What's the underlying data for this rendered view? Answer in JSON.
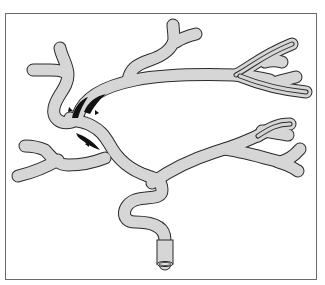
{
  "diagram": {
    "colors": {
      "background": "#ffffff",
      "frame": "#6a6a6a",
      "vessel_fill": "#d6d6d6",
      "vessel_outline": "#2a2a2a",
      "lesion": "#111111",
      "arrowhead": "#111111"
    },
    "markers": [
      {
        "name": "arrowhead-upper-left",
        "x": 70,
        "y": 109
      },
      {
        "name": "arrowhead-upper-right",
        "x": 96,
        "y": 112
      },
      {
        "name": "arrowhead-lower",
        "x": 87,
        "y": 145
      }
    ],
    "labels": []
  }
}
